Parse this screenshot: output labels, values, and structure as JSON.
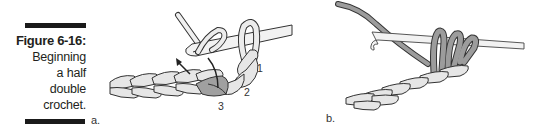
{
  "caption": {
    "title": "Figure 6-16:",
    "lines": [
      "Beginning",
      "a half",
      "double",
      "crochet."
    ]
  },
  "panels": {
    "a": {
      "label": "a.",
      "steps": [
        "1",
        "2",
        "3"
      ]
    },
    "b": {
      "label": "b."
    }
  },
  "colors": {
    "yarn_light": "#e4e4e4",
    "yarn_dark": "#9a9a9a",
    "yarn_medium": "#b8b8b8",
    "outline": "#333333",
    "hook": "#f2f2f2",
    "bar": "#1a1a1a"
  }
}
